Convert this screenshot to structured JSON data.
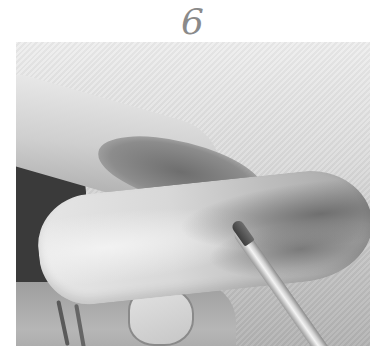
{
  "caption": {
    "label": "6"
  },
  "photo": {
    "alt": "Grayscale photo of a hand holding an elongated pale specimen with darker patches at one end, with a thin probe/pen pointing at it",
    "colors": {
      "background_light": "#eeeeee",
      "background_dark": "#b4b4b4",
      "caption_gray": "#8a8a8a"
    }
  }
}
